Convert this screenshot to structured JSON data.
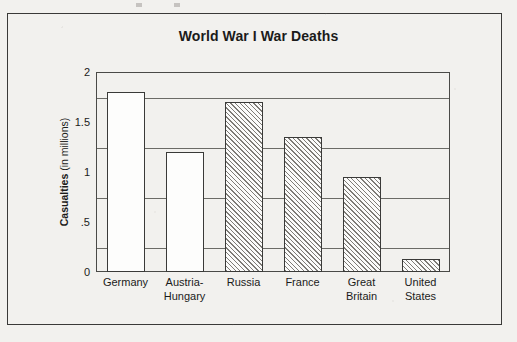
{
  "figure": {
    "title": "World War I War Deaths"
  },
  "axis": {
    "y_title_bold": "Casualties",
    "y_title_rest": " (in millions)",
    "y_ticks": [
      "2",
      "1.5",
      "1",
      ".5",
      "0"
    ]
  },
  "chart_data": {
    "type": "bar",
    "title": "World War I War Deaths",
    "xlabel": "",
    "ylabel": "Casualties (in millions)",
    "ylim": [
      0,
      2
    ],
    "ytick_values": [
      0,
      0.5,
      1,
      1.5,
      2
    ],
    "ytick_labels": [
      "0",
      ".5",
      "1",
      "1.5",
      "2"
    ],
    "gridlines": [
      0.25,
      0.75,
      1.25,
      1.75
    ],
    "grid": true,
    "legend": null,
    "categories": [
      "Germany",
      "Austria-Hungary",
      "Russia",
      "France",
      "Great Britain",
      "United States"
    ],
    "category_lines": [
      [
        "Germany"
      ],
      [
        "Austria-",
        "Hungary"
      ],
      [
        "Russia"
      ],
      [
        "France"
      ],
      [
        "Great",
        "Britain"
      ],
      [
        "United",
        "States"
      ]
    ],
    "values": [
      1.8,
      1.2,
      1.7,
      1.35,
      0.95,
      0.13
    ],
    "bar_fills": [
      "stipple",
      "stipple",
      "hatch",
      "hatch",
      "hatch",
      "hatch"
    ]
  },
  "colors": {
    "paper": "#f2f1ee",
    "ink": "#1b1b1a",
    "frame": "#3a3a38",
    "gridline": "#6b6b66",
    "bar_outline": "#3a3a38"
  }
}
